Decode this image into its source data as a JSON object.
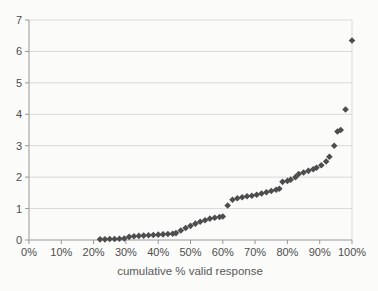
{
  "chart_data": {
    "type": "scatter",
    "title": "",
    "xlabel": "cumulative % valid response",
    "ylabel": "",
    "xlim": [
      0,
      100
    ],
    "ylim": [
      0,
      7
    ],
    "x_ticks": [
      0,
      10,
      20,
      30,
      40,
      50,
      60,
      70,
      80,
      90,
      100
    ],
    "x_tick_labels": [
      "0%",
      "10%",
      "20%",
      "30%",
      "40%",
      "50%",
      "60%",
      "70%",
      "80%",
      "90%",
      "100%"
    ],
    "y_ticks": [
      0,
      1,
      2,
      3,
      4,
      5,
      6,
      7
    ],
    "y_tick_labels": [
      "0",
      "1",
      "2",
      "3",
      "4",
      "5",
      "6",
      "7"
    ],
    "grid": "horizontal-light",
    "legend": "none",
    "marker": "diamond",
    "colors": {
      "marker": "#4d4d4d",
      "grid": "#d9d9d9",
      "axis": "#999999",
      "tick_text": "#4d4d4d",
      "title_text": "#595959",
      "background": "#fbfbfa"
    },
    "points": [
      [
        22,
        0.02
      ],
      [
        23.5,
        0.02
      ],
      [
        25,
        0.03
      ],
      [
        26.5,
        0.03
      ],
      [
        28,
        0.04
      ],
      [
        29.5,
        0.05
      ],
      [
        31,
        0.1
      ],
      [
        32.5,
        0.12
      ],
      [
        34,
        0.13
      ],
      [
        35.5,
        0.14
      ],
      [
        37,
        0.15
      ],
      [
        38.5,
        0.16
      ],
      [
        40,
        0.17
      ],
      [
        41.5,
        0.18
      ],
      [
        43,
        0.19
      ],
      [
        44.5,
        0.2
      ],
      [
        45.5,
        0.22
      ],
      [
        47,
        0.3
      ],
      [
        48.5,
        0.38
      ],
      [
        50,
        0.45
      ],
      [
        51.5,
        0.52
      ],
      [
        53,
        0.58
      ],
      [
        54.5,
        0.63
      ],
      [
        56,
        0.68
      ],
      [
        57.5,
        0.71
      ],
      [
        59,
        0.73
      ],
      [
        60,
        0.75
      ],
      [
        61.5,
        1.1
      ],
      [
        63,
        1.28
      ],
      [
        64.5,
        1.33
      ],
      [
        66,
        1.36
      ],
      [
        67.5,
        1.39
      ],
      [
        69,
        1.41
      ],
      [
        70.5,
        1.44
      ],
      [
        72,
        1.48
      ],
      [
        73.5,
        1.52
      ],
      [
        75,
        1.56
      ],
      [
        76.5,
        1.6
      ],
      [
        77.5,
        1.63
      ],
      [
        78.5,
        1.85
      ],
      [
        80,
        1.88
      ],
      [
        81,
        1.92
      ],
      [
        82.5,
        2.0
      ],
      [
        83.5,
        2.1
      ],
      [
        85,
        2.15
      ],
      [
        86.5,
        2.2
      ],
      [
        88,
        2.25
      ],
      [
        89,
        2.3
      ],
      [
        90.5,
        2.38
      ],
      [
        92,
        2.5
      ],
      [
        93,
        2.65
      ],
      [
        94.5,
        3.0
      ],
      [
        95.5,
        3.45
      ],
      [
        96.5,
        3.5
      ],
      [
        98,
        4.15
      ],
      [
        100,
        6.35
      ]
    ]
  },
  "layout": {
    "plot_left": 29,
    "plot_right": 352,
    "plot_top": 20,
    "plot_bottom": 240
  }
}
